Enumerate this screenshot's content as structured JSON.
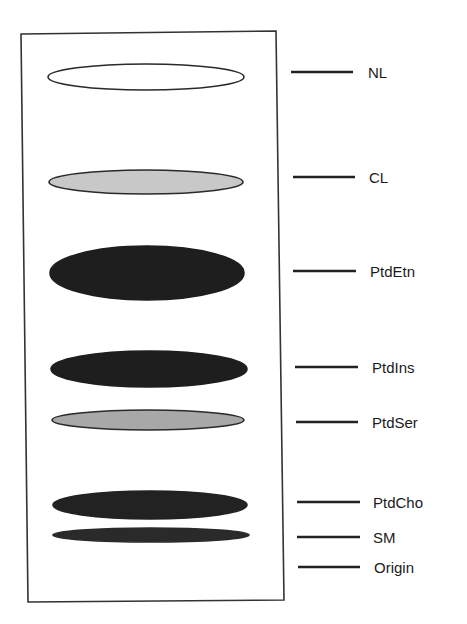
{
  "diagram": {
    "type": "thin-layer-chromatography-plate",
    "plate": {
      "corners": {
        "top_left": [
          21,
          34
        ],
        "top_right": [
          276,
          31
        ],
        "bottom_right": [
          284,
          600
        ],
        "bottom_left": [
          28,
          602
        ]
      },
      "stroke_color": "#333333",
      "fill_color": "#ffffff"
    },
    "bands": [
      {
        "id": "NL",
        "label": "NL",
        "cx": 146,
        "cy": 77,
        "rx": 98,
        "ry": 13,
        "fill": "#ffffff",
        "stroke": "#2a2a2a",
        "line_y": 72,
        "line_x1": 291,
        "line_x2": 353,
        "label_x": 368
      },
      {
        "id": "CL",
        "label": "CL",
        "cx": 146,
        "cy": 182,
        "rx": 97,
        "ry": 12,
        "fill": "#c8c8c8",
        "stroke": "#2a2a2a",
        "line_y": 177,
        "line_x1": 293,
        "line_x2": 355,
        "label_x": 369
      },
      {
        "id": "PtdEtn",
        "label": "PtdEtn",
        "cx": 147,
        "cy": 273,
        "rx": 97,
        "ry": 27,
        "fill": "#1e1e1e",
        "stroke": "#1e1e1e",
        "line_y": 271,
        "line_x1": 293,
        "line_x2": 356,
        "label_x": 370
      },
      {
        "id": "PtdIns",
        "label": "PtdIns",
        "cx": 149,
        "cy": 369,
        "rx": 98,
        "ry": 18,
        "fill": "#1e1e1e",
        "stroke": "#1e1e1e",
        "line_y": 367,
        "line_x1": 295,
        "line_x2": 358,
        "label_x": 372
      },
      {
        "id": "PtdSer",
        "label": "PtdSer",
        "cx": 148,
        "cy": 420,
        "rx": 96,
        "ry": 10,
        "fill": "#a8a8a8",
        "stroke": "#2a2a2a",
        "line_y": 422,
        "line_x1": 296,
        "line_x2": 358,
        "label_x": 372
      },
      {
        "id": "PtdCho",
        "label": "PtdCho",
        "cx": 150,
        "cy": 505,
        "rx": 97,
        "ry": 14,
        "fill": "#222222",
        "stroke": "#222222",
        "line_y": 502,
        "line_x1": 297,
        "line_x2": 360,
        "label_x": 373
      },
      {
        "id": "SM",
        "label": "SM",
        "cx": 151,
        "cy": 535,
        "rx": 98,
        "ry": 7,
        "fill": "#2a2a2a",
        "stroke": "#2a2a2a",
        "line_y": 537,
        "line_x1": 297,
        "line_x2": 360,
        "label_x": 373
      }
    ],
    "origin": {
      "label": "Origin",
      "line_y": 567,
      "line_x1": 298,
      "line_x2": 360,
      "label_x": 374
    },
    "leader_line_color": "#222222",
    "label_color": "#1a1a1a"
  }
}
